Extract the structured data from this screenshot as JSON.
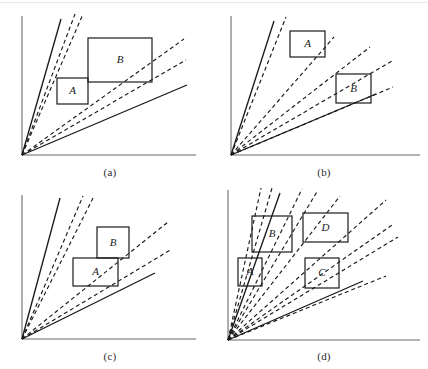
{
  "figure": {
    "background_color": "#ffffff",
    "stroke_color": "#1a1a1a",
    "axis_color": "#6b6b6b",
    "width": 428,
    "height": 369
  },
  "chart_data": {
    "type": "line",
    "xlabel": "",
    "ylabel": "",
    "grid": false,
    "legend": "none",
    "panels": [
      {
        "caption": "(a)",
        "caption_pos": [
          110,
          166
        ],
        "origin": [
          22,
          155
        ],
        "x_axis_end": [
          196,
          155
        ],
        "y_axis_top": [
          22,
          16
        ],
        "rays": [
          {
            "id": "a-s1",
            "style": "solid",
            "slope_deg": 74,
            "end": [
              61,
              19
            ]
          },
          {
            "id": "a-d1",
            "style": "dashed",
            "slope_deg": 69,
            "end": [
              75,
              14
            ]
          },
          {
            "id": "a-d2",
            "style": "dashed",
            "slope_deg": 66,
            "end": [
              83,
              14
            ]
          },
          {
            "id": "a-d3",
            "style": "dashed",
            "slope_deg": 38,
            "end": [
              184,
              39
            ]
          },
          {
            "id": "a-d4",
            "style": "dashed",
            "slope_deg": 30,
            "end": [
              186,
              60
            ]
          },
          {
            "id": "a-s2",
            "style": "solid",
            "slope_deg": 23,
            "end": [
              187,
              85
            ]
          }
        ],
        "boxes": [
          {
            "label": "A",
            "x": 57,
            "y": 78,
            "w": 31,
            "h": 26
          },
          {
            "label": "B",
            "x": 88,
            "y": 38,
            "w": 64,
            "h": 44
          }
        ]
      },
      {
        "caption": "(b)",
        "caption_pos": [
          324,
          166
        ],
        "origin": [
          231,
          155
        ],
        "x_axis_end": [
          420,
          155
        ],
        "y_axis_top": [
          231,
          16
        ],
        "rays": [
          {
            "id": "b-s1",
            "style": "solid",
            "slope_deg": 73,
            "end": [
              274,
              21
            ]
          },
          {
            "id": "b-d1",
            "style": "dashed",
            "slope_deg": 68,
            "end": [
              286,
              17
            ]
          },
          {
            "id": "b-d2",
            "style": "dashed",
            "slope_deg": 53,
            "end": [
              334,
              37
            ]
          },
          {
            "id": "b-d3",
            "style": "dashed",
            "slope_deg": 40,
            "end": [
              370,
              47
            ]
          },
          {
            "id": "b-d4",
            "style": "dashed",
            "slope_deg": 25,
            "end": [
              392,
              61
            ]
          },
          {
            "id": "b-d5",
            "style": "dashed",
            "slope_deg": 19,
            "end": [
              393,
              87
            ]
          },
          {
            "id": "b-s2",
            "style": "solid",
            "slope_deg": 18,
            "end": [
              376,
              94
            ]
          }
        ],
        "boxes": [
          {
            "label": "A",
            "x": 290,
            "y": 31,
            "w": 35,
            "h": 26
          },
          {
            "label": "B",
            "x": 336,
            "y": 74,
            "w": 35,
            "h": 29
          }
        ]
      },
      {
        "caption": "(c)",
        "caption_pos": [
          110,
          350
        ],
        "origin": [
          22,
          339
        ],
        "x_axis_end": [
          196,
          339
        ],
        "y_axis_top": [
          22,
          195
        ],
        "rays": [
          {
            "id": "c-s1",
            "style": "solid",
            "slope_deg": 74,
            "end": [
              60,
              198
            ]
          },
          {
            "id": "c-d1",
            "style": "dashed",
            "slope_deg": 66,
            "end": [
              83,
              196
            ]
          },
          {
            "id": "c-d2",
            "style": "dashed",
            "slope_deg": 62,
            "end": [
              93,
              198
            ]
          },
          {
            "id": "c-d3",
            "style": "dashed",
            "slope_deg": 40,
            "end": [
              168,
              222
            ]
          },
          {
            "id": "c-d4",
            "style": "dashed",
            "slope_deg": 31,
            "end": [
              172,
              249
            ]
          },
          {
            "id": "c-s2",
            "style": "solid",
            "slope_deg": 25,
            "end": [
              155,
              273
            ]
          }
        ],
        "boxes": [
          {
            "label": "A",
            "x": 73,
            "y": 258,
            "w": 45,
            "h": 28
          },
          {
            "label": "B",
            "x": 97,
            "y": 227,
            "w": 32,
            "h": 31
          }
        ]
      },
      {
        "caption": "(d)",
        "caption_pos": [
          324,
          350
        ],
        "origin": [
          228,
          340
        ],
        "x_axis_end": [
          420,
          340
        ],
        "y_axis_top": [
          228,
          190
        ],
        "rays": [
          {
            "id": "d-d1",
            "style": "dashed",
            "slope_deg": 77,
            "end": [
              261,
              188
            ]
          },
          {
            "id": "d-d2",
            "style": "dashed",
            "slope_deg": 73,
            "end": [
              272,
              188
            ]
          },
          {
            "id": "d-s1",
            "style": "solid",
            "slope_deg": 70,
            "end": [
              280,
              193
            ]
          },
          {
            "id": "d-d3",
            "style": "dashed",
            "slope_deg": 63,
            "end": [
              302,
              189
            ]
          },
          {
            "id": "d-d4",
            "style": "dashed",
            "slope_deg": 58,
            "end": [
              318,
              190
            ]
          },
          {
            "id": "d-d5",
            "style": "dashed",
            "slope_deg": 50,
            "end": [
              340,
              196
            ]
          },
          {
            "id": "d-d6",
            "style": "dashed",
            "slope_deg": 41,
            "end": [
              386,
              200
            ]
          },
          {
            "id": "d-d7",
            "style": "dashed",
            "slope_deg": 35,
            "end": [
              392,
              225
            ]
          },
          {
            "id": "d-d8",
            "style": "dashed",
            "slope_deg": 29,
            "end": [
              398,
              237
            ]
          },
          {
            "id": "d-d9",
            "style": "dashed",
            "slope_deg": 22,
            "end": [
              386,
              276
            ]
          },
          {
            "id": "d-s2",
            "style": "solid",
            "slope_deg": 21,
            "end": [
              363,
              281
            ]
          }
        ],
        "boxes": [
          {
            "label": "A",
            "x": 238,
            "y": 258,
            "w": 24,
            "h": 28
          },
          {
            "label": "B",
            "x": 252,
            "y": 216,
            "w": 40,
            "h": 36
          },
          {
            "label": "C",
            "x": 305,
            "y": 258,
            "w": 34,
            "h": 30
          },
          {
            "label": "D",
            "x": 303,
            "y": 213,
            "w": 45,
            "h": 29
          }
        ]
      }
    ]
  }
}
